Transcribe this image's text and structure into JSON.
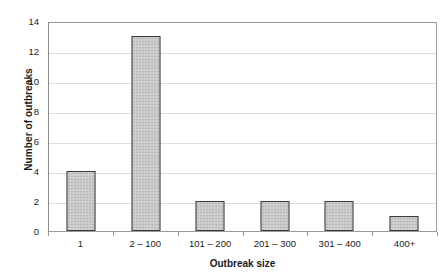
{
  "chart_data": {
    "type": "bar",
    "title": "",
    "xlabel": "Outbreak size",
    "ylabel": "Number of outbreaks",
    "categories": [
      "1",
      "2 – 100",
      "101 – 200",
      "201 – 300",
      "301 – 400",
      "400+"
    ],
    "values": [
      4,
      13,
      2,
      2,
      2,
      1
    ],
    "ylim": [
      0,
      14
    ],
    "ytick_labels": [
      "0",
      "2",
      "4",
      "6",
      "8",
      "10",
      "12",
      "14"
    ],
    "ytick_values": [
      0,
      2,
      4,
      6,
      8,
      10,
      12,
      14
    ],
    "grid": "horizontal",
    "legend": "none",
    "colors": {
      "bar_fill": "#c9c9c9",
      "bar_border": "#3a3a3a",
      "gridline": "#dcdcdc",
      "axis": "#8c8c8c",
      "text": "#1a1a1a",
      "background": "#ffffff"
    }
  }
}
